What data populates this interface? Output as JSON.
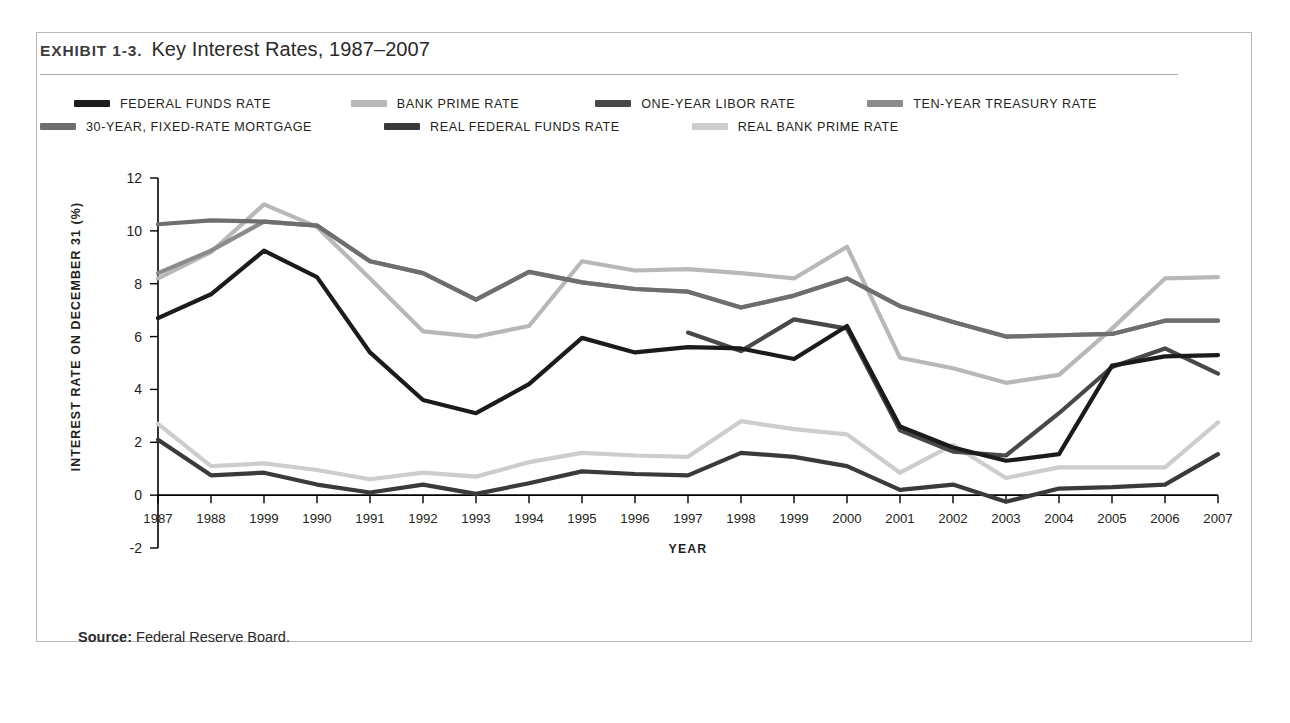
{
  "exhibit": {
    "label": "Exhibit 1-3.",
    "title": "Key Interest Rates, 1987–2007"
  },
  "source": {
    "label": "Source:",
    "text": "Federal Reserve Board."
  },
  "chart_data": {
    "type": "line",
    "title": "Key Interest Rates, 1987–2007",
    "xlabel": "YEAR",
    "ylabel": "INTEREST RATE ON DECEMBER 31 (%)",
    "ylim": [
      -2,
      12
    ],
    "yticks": [
      12,
      10,
      8,
      6,
      4,
      2,
      0,
      -2
    ],
    "grid": false,
    "legend_position": "top",
    "categories": [
      "1987",
      "1988",
      "1999",
      "1990",
      "1991",
      "1992",
      "1993",
      "1994",
      "1995",
      "1996",
      "1997",
      "1998",
      "1999",
      "2000",
      "2001",
      "2002",
      "2003",
      "2004",
      "2005",
      "2006",
      "2007"
    ],
    "series": [
      {
        "name": "FEDERAL FUNDS RATE",
        "color": "#1b1b1b",
        "width": 4.2,
        "values": [
          6.7,
          7.6,
          9.25,
          8.25,
          5.4,
          3.6,
          3.1,
          4.2,
          5.95,
          5.4,
          5.6,
          5.55,
          5.15,
          6.4,
          2.6,
          1.8,
          1.3,
          1.55,
          4.9,
          5.25,
          5.3
        ]
      },
      {
        "name": "BANK PRIME RATE",
        "color": "#b8b8b8",
        "width": 4.2,
        "values": [
          8.2,
          9.2,
          11.0,
          10.15,
          8.2,
          6.2,
          6.0,
          6.4,
          8.85,
          8.5,
          8.55,
          8.4,
          8.2,
          9.4,
          5.2,
          4.8,
          4.25,
          4.55,
          6.3,
          8.2,
          8.25
        ]
      },
      {
        "name": "ONE-YEAR LIBOR RATE",
        "color": "#484848",
        "width": 4.2,
        "values": [
          null,
          null,
          null,
          null,
          null,
          null,
          null,
          null,
          null,
          null,
          6.15,
          5.45,
          6.65,
          6.3,
          2.45,
          1.65,
          1.5,
          3.1,
          4.85,
          5.55,
          4.6
        ]
      },
      {
        "name": "TEN-YEAR TREASURY RATE",
        "color": "#8b8b8b",
        "width": 4.2,
        "values": [
          8.4,
          9.25,
          10.35,
          10.2,
          8.85,
          8.4,
          7.4,
          8.45,
          8.05,
          7.8,
          7.7,
          7.1,
          7.55,
          8.2,
          7.15,
          6.55,
          6.0,
          6.05,
          6.1,
          6.6,
          6.6
        ]
      },
      {
        "name": "30-YEAR, FIXED-RATE MORTGAGE",
        "color": "#6e6e6e",
        "width": 4.2,
        "values": [
          10.25,
          10.4,
          10.35,
          10.2,
          8.85,
          8.4,
          7.4,
          8.45,
          8.05,
          7.8,
          7.7,
          7.1,
          7.55,
          8.2,
          7.15,
          6.55,
          6.0,
          6.05,
          6.1,
          6.6,
          6.6
        ]
      },
      {
        "name": "REAL FEDERAL FUNDS RATE",
        "color": "#3a3a3a",
        "width": 4.2,
        "values": [
          2.1,
          0.75,
          0.85,
          0.4,
          0.1,
          0.4,
          0.05,
          0.45,
          0.9,
          0.8,
          0.75,
          1.6,
          1.45,
          1.1,
          0.2,
          0.4,
          -0.25,
          0.25,
          0.3,
          0.4,
          1.55
        ]
      },
      {
        "name": "REAL BANK PRIME RATE",
        "color": "#cdcdcd",
        "width": 4.2,
        "values": [
          2.7,
          1.1,
          1.2,
          0.95,
          0.6,
          0.85,
          0.7,
          1.25,
          1.6,
          1.5,
          1.45,
          2.8,
          2.5,
          2.3,
          0.85,
          1.9,
          0.65,
          1.05,
          1.05,
          1.05,
          2.75
        ]
      }
    ]
  },
  "legend": {
    "rows": [
      [
        {
          "label": "FEDERAL FUNDS RATE",
          "color": "#1b1b1b",
          "gap_before": 34
        },
        {
          "label": "BANK PRIME RATE",
          "color": "#b8b8b8",
          "gap_before": 80
        },
        {
          "label": "ONE-YEAR LIBOR RATE",
          "color": "#484848",
          "gap_before": 76
        },
        {
          "label": "TEN-YEAR TREASURY RATE",
          "color": "#8b8b8b",
          "gap_before": 72
        }
      ],
      [
        {
          "label": "30-YEAR, FIXED-RATE MORTGAGE",
          "color": "#6e6e6e",
          "gap_before": 0
        },
        {
          "label": "REAL FEDERAL FUNDS RATE",
          "color": "#3a3a3a",
          "gap_before": 72
        },
        {
          "label": "REAL BANK PRIME RATE",
          "color": "#cdcdcd",
          "gap_before": 72
        }
      ]
    ]
  }
}
